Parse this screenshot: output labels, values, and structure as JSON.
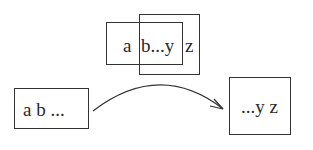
{
  "diagram": {
    "top_group": {
      "box_back": {
        "label": "a b...y"
      },
      "box_front": {
        "label": "b...y z"
      },
      "label_a": "a",
      "label_mid": "b...y",
      "label_z": "z"
    },
    "left_box": {
      "label": "a b ..."
    },
    "right_box": {
      "label": "...y z"
    },
    "arrow": {
      "from": "left_box",
      "to": "right_box",
      "style": "curved"
    }
  },
  "colors": {
    "stroke": "#333333",
    "text": "#2a2a2a",
    "background": "#ffffff"
  }
}
